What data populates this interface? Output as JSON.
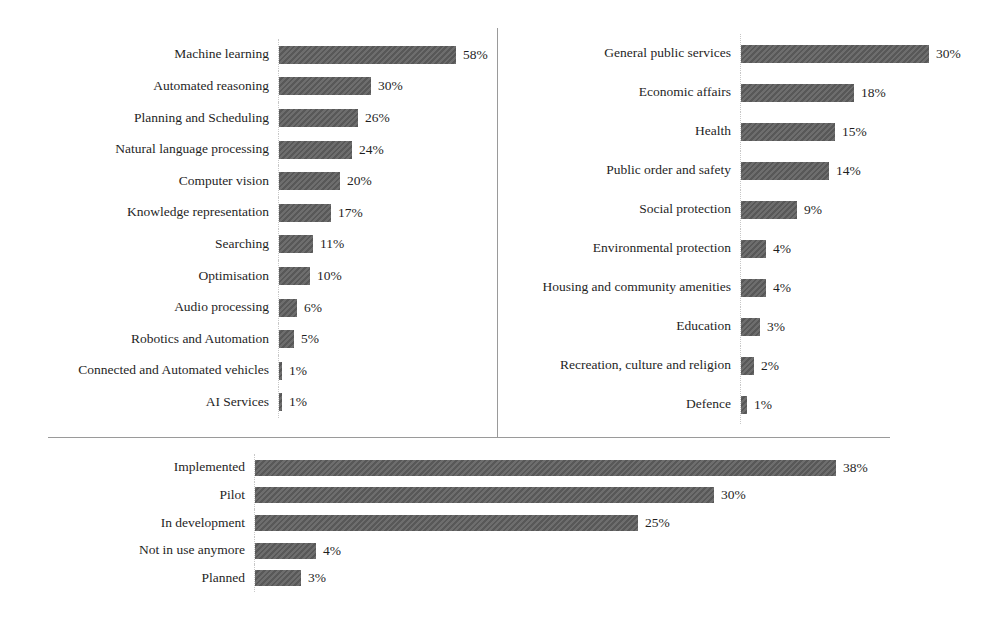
{
  "figure": {
    "background_color": "#ffffff",
    "bar_color": "#5d5d5d",
    "text_color": "#1f1f1f",
    "divider_color": "#9a9a9a"
  },
  "chart_data": [
    {
      "type": "bar",
      "orientation": "horizontal",
      "panel": "top-left",
      "title": "",
      "unit": "%",
      "xlim": [
        0,
        65
      ],
      "grid": false,
      "legend": "none",
      "categories": [
        "Machine learning",
        "Automated reasoning",
        "Planning and Scheduling",
        "Natural language processing",
        "Computer vision",
        "Knowledge representation",
        "Searching",
        "Optimisation",
        "Audio processing",
        "Robotics and Automation",
        "Connected and Automated vehicles",
        "AI Services"
      ],
      "values": [
        58,
        30,
        26,
        24,
        20,
        17,
        11,
        10,
        6,
        5,
        1,
        1
      ],
      "value_labels": [
        "58%",
        "30%",
        "26%",
        "24%",
        "20%",
        "17%",
        "11%",
        "10%",
        "6%",
        "5%",
        "1%",
        "1%"
      ]
    },
    {
      "type": "bar",
      "orientation": "horizontal",
      "panel": "top-right",
      "title": "",
      "unit": "%",
      "xlim": [
        0,
        35
      ],
      "grid": false,
      "legend": "none",
      "categories": [
        "General public services",
        "Economic affairs",
        "Health",
        "Public order and safety",
        "Social protection",
        "Environmental protection",
        "Housing and community amenities",
        "Education",
        "Recreation, culture and religion",
        "Defence"
      ],
      "values": [
        30,
        18,
        15,
        14,
        9,
        4,
        4,
        3,
        2,
        1
      ],
      "value_labels": [
        "30%",
        "18%",
        "15%",
        "14%",
        "9%",
        "4%",
        "4%",
        "3%",
        "2%",
        "1%"
      ]
    },
    {
      "type": "bar",
      "orientation": "horizontal",
      "panel": "bottom",
      "title": "",
      "unit": "%",
      "xlim": [
        0,
        42
      ],
      "grid": false,
      "legend": "none",
      "categories": [
        "Implemented",
        "Pilot",
        "In development",
        "Not in use anymore",
        "Planned"
      ],
      "values": [
        38,
        30,
        25,
        4,
        3
      ],
      "value_labels": [
        "38%",
        "30%",
        "25%",
        "4%",
        "3%"
      ]
    }
  ]
}
